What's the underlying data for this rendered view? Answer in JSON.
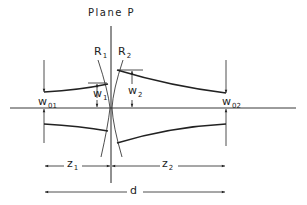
{
  "diagram": {
    "title": "Plane P",
    "labels": {
      "R1": {
        "main": "R",
        "sub": "1"
      },
      "R2": {
        "main": "R",
        "sub": "2"
      },
      "w1": {
        "main": "w",
        "sub": "1"
      },
      "w2": {
        "main": "w",
        "sub": "2"
      },
      "w01": {
        "main": "w",
        "sub": "01"
      },
      "w02": {
        "main": "w",
        "sub": "02"
      },
      "z1": {
        "main": "z",
        "sub": "1"
      },
      "z2": {
        "main": "z",
        "sub": "2"
      },
      "d": {
        "main": "d",
        "sub": ""
      }
    },
    "colors": {
      "line": "#222222",
      "background": "#ffffff"
    }
  }
}
